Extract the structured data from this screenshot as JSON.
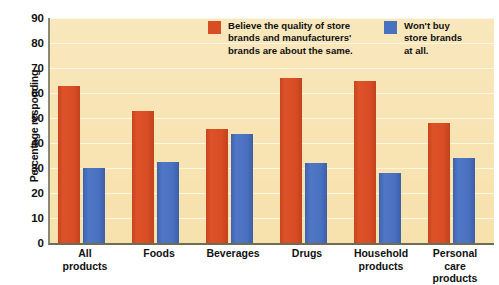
{
  "chart_data": {
    "type": "bar",
    "title": "",
    "xlabel": "",
    "ylabel": "Percentage responding",
    "ylim": [
      0,
      90
    ],
    "yticks": [
      90,
      80,
      70,
      60,
      50,
      40,
      30,
      20,
      10,
      0
    ],
    "grid": true,
    "legend_position": "top-right",
    "categories": [
      "All\nproducts",
      "Foods",
      "Beverages",
      "Drugs",
      "Household\nproducts",
      "Personal\ncare\nproducts"
    ],
    "series": [
      {
        "name": "Believe the quality of store\nbrands and manufacturers'\nbrands are about the same.",
        "color": "#d94d24",
        "values": [
          63,
          53,
          45.5,
          66,
          65,
          48
        ]
      },
      {
        "name": "Won't buy\nstore brands\nat all.",
        "color": "#4a70c0",
        "values": [
          30,
          32.5,
          43.5,
          32,
          28,
          34
        ]
      }
    ]
  },
  "colors": {
    "red": "#d94d24",
    "blue": "#4a70c0",
    "plot_background": "#f8e4b4",
    "gridline": "#fdf6e2",
    "axis": "#6d6d55",
    "text": "#111111"
  }
}
